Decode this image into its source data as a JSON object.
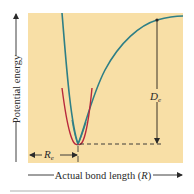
{
  "figure": {
    "type": "potential-energy-curve",
    "y_axis_label": "Potential energy",
    "x_axis_label_prefix": "Actual bond length (",
    "x_axis_label_var": "R",
    "x_axis_label_suffix": ")",
    "dissociation_energy_symbol": "D",
    "dissociation_energy_subscript": "e",
    "equilibrium_length_symbol": "R",
    "equilibrium_length_subscript": "e",
    "curves": [
      {
        "name": "Morse (actual) potential",
        "color": "#2E7F86"
      },
      {
        "name": "Harmonic approximation",
        "color": "#B8283C"
      }
    ],
    "colors": {
      "plot_background": "#F8DFA6",
      "annotation": "#2a2a2a",
      "caption_faint": "#d6d6d6"
    }
  }
}
